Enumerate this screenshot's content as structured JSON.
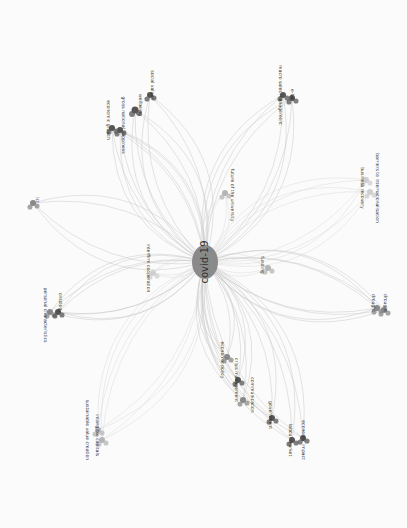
{
  "diagram": {
    "type": "keyword-co-occurrence-network",
    "orientation": "rotated-90-clockwise",
    "center": {
      "label": "covid-19",
      "x": 205,
      "y": 262,
      "rx": 13,
      "ry": 17,
      "color": "#8a8a8a"
    },
    "colors": {
      "dark_node": "#555555",
      "mid_node": "#888888",
      "light_node": "#b5b5b5",
      "faint_node": "#cfcfcf",
      "edge": "#c9c9c9",
      "background": "#fbfbfb"
    },
    "clusters": [
      {
        "id": "wellbeing",
        "nodes": [
          {
            "label": "economic growth",
            "x": 112,
            "y": 128,
            "r": 3,
            "tone": "dark",
            "lx": 108,
            "ly": 120
          },
          {
            "label": "gross national happiness",
            "x": 120,
            "y": 130,
            "r": 3,
            "tone": "dark",
            "lx": 123,
            "ly": 125
          },
          {
            "label": "wellbeing",
            "x": 135,
            "y": 110,
            "r": 3.5,
            "tone": "dark",
            "lx": 140,
            "ly": 105
          },
          {
            "label": "social values",
            "x": 150,
            "y": 95,
            "r": 3,
            "tone": "dark",
            "lx": 152,
            "ly": 85
          }
        ]
      },
      {
        "id": "macro",
        "nodes": [
          {
            "label": "macro sales management",
            "x": 283,
            "y": 95,
            "r": 3,
            "tone": "dark",
            "lx": 280,
            "ly": 95
          },
          {
            "label": "e-bar",
            "x": 292,
            "y": 98,
            "r": 3,
            "tone": "dark",
            "lx": 292,
            "ly": 95
          }
        ]
      },
      {
        "id": "university",
        "nodes": [
          {
            "label": "future of the university",
            "x": 225,
            "y": 193,
            "r": 3,
            "tone": "light",
            "lx": 232,
            "ly": 195
          }
        ]
      },
      {
        "id": "business",
        "nodes": [
          {
            "label": "business recovery",
            "x": 366,
            "y": 180,
            "r": 3,
            "tone": "faint",
            "lx": 362,
            "ly": 188
          },
          {
            "label": "barriers to internationalisation",
            "x": 370,
            "y": 192,
            "r": 3,
            "tone": "faint",
            "lx": 377,
            "ly": 188
          }
        ]
      },
      {
        "id": "ict",
        "nodes": [
          {
            "label": "ict",
            "x": 33,
            "y": 203,
            "r": 3,
            "tone": "mid",
            "lx": 37,
            "ly": 200
          }
        ]
      },
      {
        "id": "cooperation",
        "nodes": [
          {
            "label": "interfirm cooperation",
            "x": 153,
            "y": 273,
            "r": 3,
            "tone": "faint",
            "lx": 148,
            "ly": 268
          }
        ]
      },
      {
        "id": "funding",
        "nodes": [
          {
            "label": "funding",
            "x": 268,
            "y": 268,
            "r": 3,
            "tone": "light",
            "lx": 262,
            "ly": 265
          }
        ]
      },
      {
        "id": "personal",
        "nodes": [
          {
            "label": "personal characteristics",
            "x": 50,
            "y": 312,
            "r": 3,
            "tone": "mid",
            "lx": 45,
            "ly": 315
          },
          {
            "label": "ontology",
            "x": 58,
            "y": 312,
            "r": 3,
            "tone": "dark",
            "lx": 60,
            "ly": 303
          }
        ]
      },
      {
        "id": "drought",
        "nodes": [
          {
            "label": "drought",
            "x": 377,
            "y": 308,
            "r": 3,
            "tone": "mid",
            "lx": 373,
            "ly": 303
          },
          {
            "label": "drought",
            "x": 384,
            "y": 310,
            "r": 3,
            "tone": "mid",
            "lx": 385,
            "ly": 303
          }
        ]
      },
      {
        "id": "value",
        "nodes": [
          {
            "label": "sustainable value creation",
            "x": 98,
            "y": 430,
            "r": 3,
            "tone": "light",
            "lx": 87,
            "ly": 430
          },
          {
            "label": "intangible capitals",
            "x": 102,
            "y": 440,
            "r": 3,
            "tone": "light",
            "lx": 97,
            "ly": 435
          }
        ]
      },
      {
        "id": "policy",
        "nodes": [
          {
            "label": "economic policy",
            "x": 227,
            "y": 357,
            "r": 3,
            "tone": "mid",
            "lx": 222,
            "ly": 360
          },
          {
            "label": "crisis management",
            "x": 238,
            "y": 380,
            "r": 3,
            "tone": "dark",
            "lx": 236,
            "ly": 380
          },
          {
            "label": "communication",
            "x": 243,
            "y": 400,
            "r": 3,
            "tone": "mid",
            "lx": 252,
            "ly": 395
          }
        ]
      },
      {
        "id": "government",
        "nodes": [
          {
            "label": "government",
            "x": 272,
            "y": 418,
            "r": 3,
            "tone": "dark",
            "lx": 270,
            "ly": 415
          },
          {
            "label": "labour market",
            "x": 292,
            "y": 440,
            "r": 3,
            "tone": "dark",
            "lx": 290,
            "ly": 440
          },
          {
            "label": "economic impact",
            "x": 303,
            "y": 438,
            "r": 3,
            "tone": "dark",
            "lx": 303,
            "ly": 440
          }
        ]
      }
    ]
  }
}
